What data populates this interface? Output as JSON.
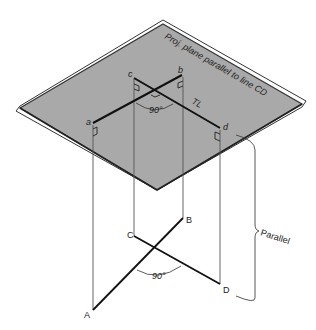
{
  "figure": {
    "plane_label": "Proj. plane parallel to line CD",
    "plane_color": "#a9a9a9",
    "true_length_label": "TL",
    "angle_top_label": "90°",
    "angle_bottom_label": "90°",
    "parallel_label": "Parallel",
    "projected_points": {
      "a": "a",
      "b": "b",
      "c": "c",
      "d": "d"
    },
    "space_points": {
      "A": "A",
      "B": "B",
      "C": "C",
      "D": "D"
    }
  }
}
